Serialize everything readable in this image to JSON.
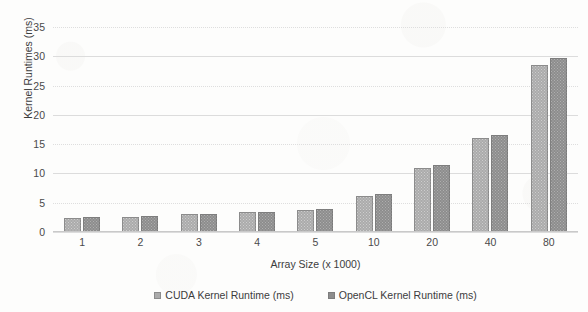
{
  "chart_data": {
    "type": "bar",
    "title": "",
    "xlabel": "Array Size (x 1000)",
    "ylabel": "Kernel Runtimes (ms)",
    "categories": [
      "1",
      "2",
      "3",
      "4",
      "5",
      "10",
      "20",
      "40",
      "80"
    ],
    "series": [
      {
        "name": "CUDA Kernel Runtime (ms)",
        "color": "#ababab",
        "values": [
          2.4,
          2.6,
          3.0,
          3.4,
          3.8,
          6.1,
          10.9,
          16.0,
          28.5
        ]
      },
      {
        "name": "OpenCL Kernel Runtime (ms)",
        "color": "#8d8d8d",
        "values": [
          2.5,
          2.8,
          3.1,
          3.5,
          3.9,
          6.5,
          11.4,
          16.5,
          29.7
        ]
      }
    ],
    "ylim": [
      0,
      35
    ],
    "ytick_values": [
      0,
      5,
      10,
      15,
      20,
      25,
      30,
      35
    ],
    "ytick_labels": [
      "0",
      "5",
      "10",
      "15",
      "20",
      "25",
      "30",
      "35"
    ],
    "grid": true,
    "grid_axis": "y",
    "legend_position": "bottom",
    "background_color": "#fdfdfc",
    "gridline_color": "#dcdcdc"
  }
}
